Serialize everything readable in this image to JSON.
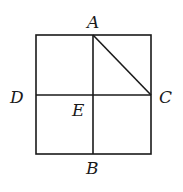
{
  "diagram": {
    "points": {
      "A": "A",
      "B": "B",
      "C": "C",
      "D": "D",
      "E": "E"
    },
    "segments": [
      [
        "A",
        "B"
      ],
      [
        "D",
        "C"
      ],
      [
        "A",
        "C"
      ]
    ],
    "colors": {
      "stroke": "#1a1a1a",
      "background": "#ffffff"
    }
  }
}
